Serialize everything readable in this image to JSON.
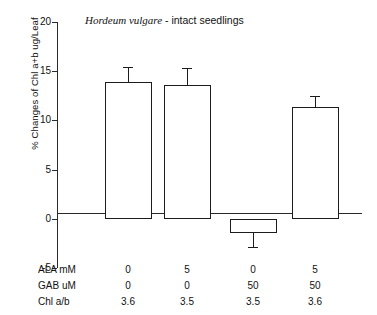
{
  "chart_data": {
    "type": "bar",
    "title": "Hordeum vulgare - intact seedlings",
    "title_species": "Hordeum vulgare",
    "title_rest": " - intact seedlings",
    "xlabel": "",
    "ylabel": "% Changes of Chl a+b ug/Leaf",
    "ylim": [
      -5,
      20
    ],
    "yticks": [
      20,
      15,
      10,
      5,
      0,
      -5
    ],
    "ytick_labels": [
      "20",
      "15",
      "10",
      "5",
      "0",
      "-5"
    ],
    "grid": false,
    "legend": false,
    "categories": [
      "1",
      "2",
      "3",
      "4"
    ],
    "values": [
      13.9,
      13.6,
      -1.4,
      11.4
    ],
    "errors": [
      1.5,
      1.7,
      1.5,
      1.1
    ],
    "conditions": {
      "rows": [
        {
          "name": "ALA mM",
          "values": [
            "0",
            "5",
            "0",
            "5"
          ]
        },
        {
          "name": "GAB uM",
          "values": [
            "0",
            "0",
            "50",
            "50"
          ]
        },
        {
          "name": "Chl a/b",
          "values": [
            "3.6",
            "3.5",
            "3.5",
            "3.6"
          ]
        }
      ]
    },
    "colors": {
      "bar_fill": "#ffffff",
      "bar_edge": "#1c1c1c",
      "axis": "#2a2a2a",
      "text": "#111111",
      "background": "#ffffff"
    }
  }
}
